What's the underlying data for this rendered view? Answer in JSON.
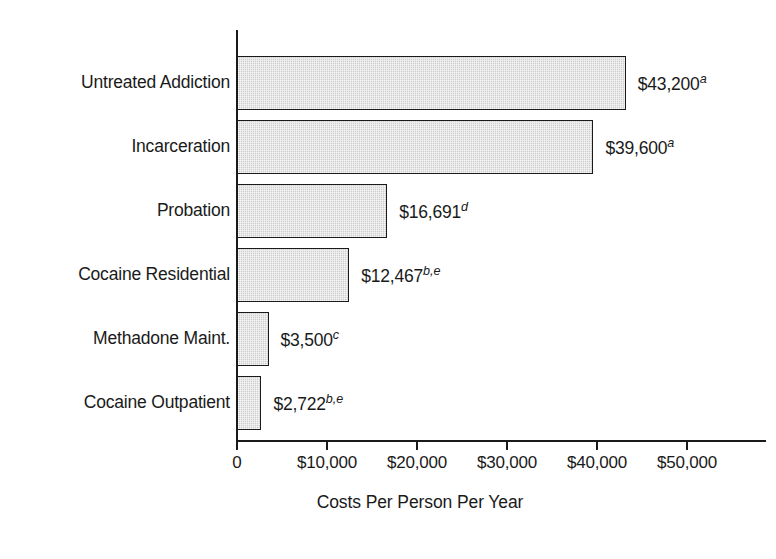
{
  "chart_data": {
    "type": "bar",
    "orientation": "horizontal",
    "title": "",
    "xlabel": "Costs Per Person Per Year",
    "ylabel": "",
    "xlim": [
      0,
      50000
    ],
    "grid": false,
    "legend": "none",
    "categories": [
      "Untreated Addiction",
      "Incarceration",
      "Probation",
      "Cocaine Residential",
      "Methadone Maint.",
      "Cocaine Outpatient"
    ],
    "values": [
      43200,
      39600,
      16691,
      12467,
      3500,
      2722
    ],
    "value_labels": [
      {
        "text": "$43,200",
        "footnote": "a"
      },
      {
        "text": "$39,600",
        "footnote": "a"
      },
      {
        "text": "$16,691",
        "footnote": "d"
      },
      {
        "text": "$12,467",
        "footnote": "b,e"
      },
      {
        "text": "$3,500",
        "footnote": "c"
      },
      {
        "text": "$2,722",
        "footnote": "b,e"
      }
    ],
    "xticks": [
      0,
      10000,
      20000,
      30000,
      40000,
      50000
    ],
    "xtick_labels": [
      "0",
      "$10,000",
      "$20,000",
      "$30,000",
      "$40,000",
      "$50,000"
    ],
    "bar_fill_color": "#cdcdcd",
    "bar_edge_color": "#1a1a1a",
    "axis_color": "#1a1a1a",
    "background_color": "#ffffff"
  }
}
